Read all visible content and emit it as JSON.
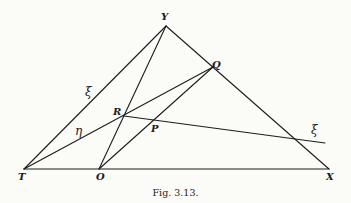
{
  "figure": {
    "caption": "Fig. 3.13.",
    "labels": {
      "Y": "Y",
      "Q": "Q",
      "T": "T",
      "O": "O",
      "X": "X",
      "R": "R",
      "P": "P",
      "xi_left": "ξ",
      "xi_right": "ξ",
      "eta": "η"
    },
    "points": {
      "T": [
        24,
        169
      ],
      "O": [
        99,
        169
      ],
      "X": [
        329,
        169
      ],
      "Y": [
        166,
        26
      ],
      "Q": [
        213,
        67
      ],
      "R": [
        124,
        116
      ],
      "P": [
        156,
        120
      ],
      "xi_end": [
        325,
        143
      ]
    },
    "segments": [
      [
        "T",
        "X"
      ],
      [
        "T",
        "Y"
      ],
      [
        "Y",
        "X"
      ],
      [
        "Y",
        "O"
      ],
      [
        "O",
        "Q"
      ],
      [
        "T",
        "Q"
      ],
      [
        "R",
        "xi_end"
      ]
    ]
  }
}
